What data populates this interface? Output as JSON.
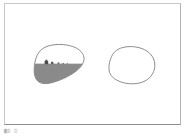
{
  "document": {
    "kind": "scanned-figure-page",
    "background_color": "#ffffff",
    "frame_border_color": "#bdbdbd"
  },
  "figure": {
    "name": "paired-blob-diagram",
    "outline_color": "#8c8c8c",
    "fill_color": "#8a8a8a",
    "detail_color": "#4a4a4a",
    "shapes": [
      {
        "id": "left-blob",
        "label": "filled-blob",
        "filled": true,
        "fill_color": "#8a8a8a",
        "outline_color": "#8c8c8c",
        "horizon": "gray region occupies lower portion beneath a straight horizon line",
        "details": [
          {
            "id": "bump-1",
            "kind": "dark-bump",
            "color": "#4a4a4a"
          },
          {
            "id": "bump-2",
            "kind": "dark-bump",
            "color": "#5a5a5a"
          },
          {
            "id": "bump-3",
            "kind": "dark-bump",
            "color": "#6a6a6a"
          },
          {
            "id": "bump-4",
            "kind": "dark-bump",
            "color": "#707070"
          }
        ]
      },
      {
        "id": "right-blob",
        "label": "empty-blob",
        "filled": false,
        "fill_color": "#ffffff",
        "outline_color": "#8c8c8c",
        "details": []
      }
    ]
  },
  "caption": {
    "mark_left": "▓▒",
    "mark_right": "▒"
  }
}
